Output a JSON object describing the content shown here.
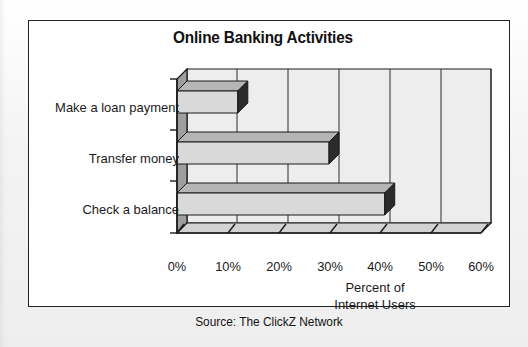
{
  "figure": {
    "source_note": "Source: The ClickZ Network"
  },
  "chart_data": {
    "type": "bar",
    "orientation": "horizontal",
    "style": "3d",
    "title": "Online Banking Activities",
    "xlabel_lines": [
      "Percent of",
      "Internet Users"
    ],
    "xlabel": "Percent of Internet Users",
    "ylabel": "",
    "categories": [
      "Make a loan payment",
      "Transfer money",
      "Check a balance"
    ],
    "values": [
      12,
      30,
      41
    ],
    "value_suffix": "%",
    "xlim": [
      0,
      60
    ],
    "xticks": [
      0,
      10,
      20,
      30,
      40,
      50,
      60
    ],
    "xtick_labels": [
      "0%",
      "10%",
      "20%",
      "30%",
      "40%",
      "50%",
      "60%"
    ],
    "grid": true,
    "grid_axis": "x",
    "legend": false,
    "colors": {
      "bar_face": "#d9d9d9",
      "bar_top": "#b5b5b5",
      "bar_cap": "#2b2b2b",
      "plot_back": "#ededed",
      "plot_side": "#9e9e9e",
      "plot_floor": "#d2d2d2",
      "axis_line": "#1a1a1a",
      "grid_line": "#3c3c3c",
      "text": "#1a1a1a",
      "frame": "#222222",
      "page_bg": "#f2f2f2"
    }
  }
}
